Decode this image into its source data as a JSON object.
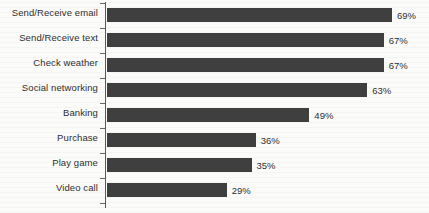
{
  "chart_data": {
    "type": "bar",
    "orientation": "horizontal",
    "title": "",
    "xlabel": "",
    "ylabel": "",
    "categories": [
      "Send/Receive email",
      "Send/Receive text",
      "Check weather",
      "Social networking",
      "Banking",
      "Purchase",
      "Play game",
      "Video call"
    ],
    "values": [
      69,
      67,
      67,
      63,
      49,
      36,
      35,
      29
    ],
    "value_labels": [
      "69%",
      "67%",
      "67%",
      "63%",
      "49%",
      "36%",
      "35%",
      "29%"
    ],
    "unit": "%",
    "xlim": [
      0,
      75
    ],
    "grid": false,
    "legend": false,
    "bar_color": "#3f3f3f",
    "text_color": "#2f2f2f",
    "background_color": "#fbfbfa"
  }
}
